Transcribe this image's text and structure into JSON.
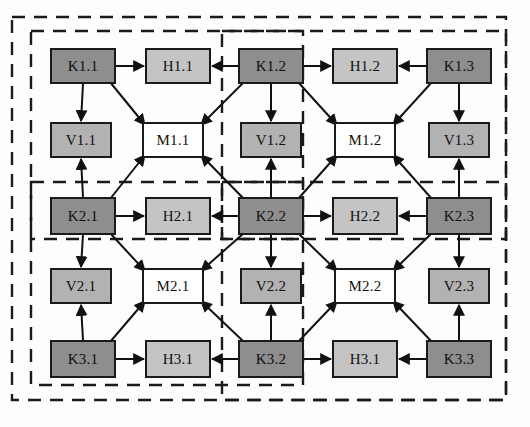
{
  "diagram": {
    "node_fills": {
      "K": "#8e8e8e",
      "H": "#c4c4c4",
      "V": "#b2b2b2",
      "M": "#ffffff"
    },
    "stroke": "#1a1a1a",
    "dash_stroke": "#1a1a1a",
    "nodes": [
      {
        "id": "K1_1",
        "label": "K1.1",
        "type": "K",
        "x": 50,
        "y": 48,
        "w": 66,
        "h": 36
      },
      {
        "id": "H1_1",
        "label": "H1.1",
        "type": "H",
        "x": 145,
        "y": 48,
        "w": 66,
        "h": 36
      },
      {
        "id": "K1_2",
        "label": "K1.2",
        "type": "K",
        "x": 238,
        "y": 48,
        "w": 66,
        "h": 36
      },
      {
        "id": "H1_2",
        "label": "H1.2",
        "type": "H",
        "x": 332,
        "y": 48,
        "w": 66,
        "h": 36
      },
      {
        "id": "K1_3",
        "label": "K1.3",
        "type": "K",
        "x": 426,
        "y": 48,
        "w": 66,
        "h": 36
      },
      {
        "id": "V1_1",
        "label": "V1.1",
        "type": "V",
        "x": 50,
        "y": 122,
        "w": 62,
        "h": 36
      },
      {
        "id": "M1_1",
        "label": "M1.1",
        "type": "M",
        "x": 142,
        "y": 122,
        "w": 62,
        "h": 36
      },
      {
        "id": "V1_2",
        "label": "V1.2",
        "type": "V",
        "x": 240,
        "y": 122,
        "w": 62,
        "h": 36
      },
      {
        "id": "M1_2",
        "label": "M1.2",
        "type": "M",
        "x": 334,
        "y": 122,
        "w": 62,
        "h": 36
      },
      {
        "id": "V1_3",
        "label": "V1.3",
        "type": "V",
        "x": 428,
        "y": 122,
        "w": 62,
        "h": 36
      },
      {
        "id": "K2_1",
        "label": "K2.1",
        "type": "K",
        "x": 50,
        "y": 197,
        "w": 66,
        "h": 38
      },
      {
        "id": "H2_1",
        "label": "H2.1",
        "type": "H",
        "x": 145,
        "y": 197,
        "w": 66,
        "h": 38
      },
      {
        "id": "K2_2",
        "label": "K2.2",
        "type": "K",
        "x": 238,
        "y": 197,
        "w": 66,
        "h": 38
      },
      {
        "id": "H2_2",
        "label": "H2.2",
        "type": "H",
        "x": 332,
        "y": 197,
        "w": 66,
        "h": 38
      },
      {
        "id": "K2_3",
        "label": "K2.3",
        "type": "K",
        "x": 426,
        "y": 197,
        "w": 66,
        "h": 38
      },
      {
        "id": "V2_1",
        "label": "V2.1",
        "type": "V",
        "x": 50,
        "y": 268,
        "w": 62,
        "h": 36
      },
      {
        "id": "M2_1",
        "label": "M2.1",
        "type": "M",
        "x": 142,
        "y": 268,
        "w": 62,
        "h": 36
      },
      {
        "id": "V2_2",
        "label": "V2.2",
        "type": "V",
        "x": 240,
        "y": 268,
        "w": 62,
        "h": 36
      },
      {
        "id": "M2_2",
        "label": "M2.2",
        "type": "M",
        "x": 334,
        "y": 268,
        "w": 62,
        "h": 36
      },
      {
        "id": "V2_3",
        "label": "V2.3",
        "type": "V",
        "x": 428,
        "y": 268,
        "w": 62,
        "h": 36
      },
      {
        "id": "K3_1",
        "label": "K3.1",
        "type": "K",
        "x": 50,
        "y": 340,
        "w": 66,
        "h": 38
      },
      {
        "id": "H3_1",
        "label": "H3.1",
        "type": "H",
        "x": 145,
        "y": 340,
        "w": 66,
        "h": 38
      },
      {
        "id": "K3_2",
        "label": "K3.2",
        "type": "K",
        "x": 238,
        "y": 340,
        "w": 66,
        "h": 38
      },
      {
        "id": "H3_1b",
        "label": "H3.1",
        "type": "H",
        "x": 332,
        "y": 340,
        "w": 66,
        "h": 38
      },
      {
        "id": "K3_3",
        "label": "K3.3",
        "type": "K",
        "x": 426,
        "y": 340,
        "w": 66,
        "h": 38
      }
    ],
    "dashed_regions": [
      {
        "id": "region-outer",
        "x": 12,
        "y": 17,
        "w": 494,
        "h": 383
      },
      {
        "id": "region-upper-left",
        "x": 31,
        "y": 31,
        "w": 272,
        "h": 208
      },
      {
        "id": "region-lower-left",
        "x": 31,
        "y": 182,
        "w": 272,
        "h": 203
      },
      {
        "id": "region-upper-right",
        "x": 222,
        "y": 31,
        "w": 284,
        "h": 208
      },
      {
        "id": "region-lower-right",
        "x": 222,
        "y": 182,
        "w": 284,
        "h": 218
      }
    ],
    "edges": [
      {
        "from": "K1_1",
        "to": "H1_1",
        "kind": "horizontal"
      },
      {
        "from": "K1_2",
        "to": "H1_1",
        "kind": "horizontal"
      },
      {
        "from": "K1_2",
        "to": "H1_2",
        "kind": "horizontal"
      },
      {
        "from": "K1_3",
        "to": "H1_2",
        "kind": "horizontal"
      },
      {
        "from": "K1_1",
        "to": "V1_1",
        "kind": "vertical"
      },
      {
        "from": "K1_2",
        "to": "V1_2",
        "kind": "vertical"
      },
      {
        "from": "K1_3",
        "to": "V1_3",
        "kind": "vertical"
      },
      {
        "from": "K1_1",
        "to": "M1_1",
        "kind": "diagonal"
      },
      {
        "from": "K1_2",
        "to": "M1_1",
        "kind": "diagonal"
      },
      {
        "from": "K1_2",
        "to": "M1_2",
        "kind": "diagonal"
      },
      {
        "from": "K1_3",
        "to": "M1_2",
        "kind": "diagonal"
      },
      {
        "from": "K2_1",
        "to": "H2_1",
        "kind": "horizontal"
      },
      {
        "from": "K2_2",
        "to": "H2_1",
        "kind": "horizontal"
      },
      {
        "from": "K2_2",
        "to": "H2_2",
        "kind": "horizontal"
      },
      {
        "from": "K2_3",
        "to": "H2_2",
        "kind": "horizontal"
      },
      {
        "from": "K2_1",
        "to": "V1_1",
        "kind": "vertical-up"
      },
      {
        "from": "K2_2",
        "to": "V1_2",
        "kind": "vertical-up"
      },
      {
        "from": "K2_3",
        "to": "V1_3",
        "kind": "vertical-up"
      },
      {
        "from": "K2_1",
        "to": "M1_1",
        "kind": "diagonal-up"
      },
      {
        "from": "K2_2",
        "to": "M1_1",
        "kind": "diagonal-up"
      },
      {
        "from": "K2_2",
        "to": "M1_2",
        "kind": "diagonal-up"
      },
      {
        "from": "K2_3",
        "to": "M1_2",
        "kind": "diagonal-up"
      },
      {
        "from": "K2_1",
        "to": "V2_1",
        "kind": "vertical"
      },
      {
        "from": "K2_2",
        "to": "V2_2",
        "kind": "vertical"
      },
      {
        "from": "K2_3",
        "to": "V2_3",
        "kind": "vertical"
      },
      {
        "from": "K2_1",
        "to": "M2_1",
        "kind": "diagonal"
      },
      {
        "from": "K2_2",
        "to": "M2_1",
        "kind": "diagonal"
      },
      {
        "from": "K2_2",
        "to": "M2_2",
        "kind": "diagonal"
      },
      {
        "from": "K2_3",
        "to": "M2_2",
        "kind": "diagonal"
      },
      {
        "from": "K3_1",
        "to": "H3_1",
        "kind": "horizontal"
      },
      {
        "from": "K3_2",
        "to": "H3_1",
        "kind": "horizontal"
      },
      {
        "from": "K3_2",
        "to": "H3_1b",
        "kind": "horizontal"
      },
      {
        "from": "K3_3",
        "to": "H3_1b",
        "kind": "horizontal"
      },
      {
        "from": "K3_1",
        "to": "V2_1",
        "kind": "vertical-up"
      },
      {
        "from": "K3_2",
        "to": "V2_2",
        "kind": "vertical-up"
      },
      {
        "from": "K3_3",
        "to": "V2_3",
        "kind": "vertical-up"
      },
      {
        "from": "K3_1",
        "to": "M2_1",
        "kind": "diagonal-up"
      },
      {
        "from": "K3_2",
        "to": "M2_1",
        "kind": "diagonal-up"
      },
      {
        "from": "K3_2",
        "to": "M2_2",
        "kind": "diagonal-up"
      },
      {
        "from": "K3_3",
        "to": "M2_2",
        "kind": "diagonal-up"
      }
    ]
  }
}
